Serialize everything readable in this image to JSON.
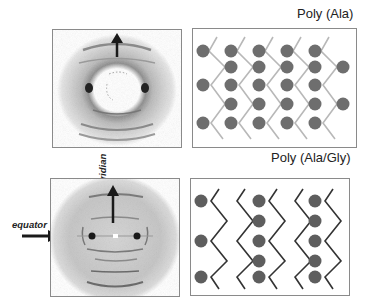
{
  "figure": {
    "panels": [
      {
        "id": "poly-ala-xrd",
        "type": "x-ray diffraction pattern",
        "arrow": "meridian"
      },
      {
        "id": "poly-ala-model",
        "title": "Poly (Ala)",
        "type": "beta-sheet packing model",
        "columns": 6,
        "strands": 5
      },
      {
        "id": "poly-ala-gly-xrd",
        "type": "x-ray diffraction pattern",
        "annotations": {
          "meridian": "meridian",
          "equator": "equator"
        }
      },
      {
        "id": "poly-ala-gly-model",
        "title": "Poly (Ala/Gly)",
        "type": "beta-sheet packing model",
        "strands": 4
      }
    ]
  },
  "labels": {
    "poly_ala": "Poly (Ala)",
    "poly_ala_gly": "Poly (Ala/Gly)",
    "meridian": "meridian",
    "equator": "equator"
  },
  "colors": {
    "sphere": "#6e6e6e",
    "chain_light": "#b8b8b8",
    "chain_dark": "#333333",
    "frame": "#8a8a8a",
    "arrow": "#1a1a1a",
    "scatter": "#9a9a9a"
  }
}
